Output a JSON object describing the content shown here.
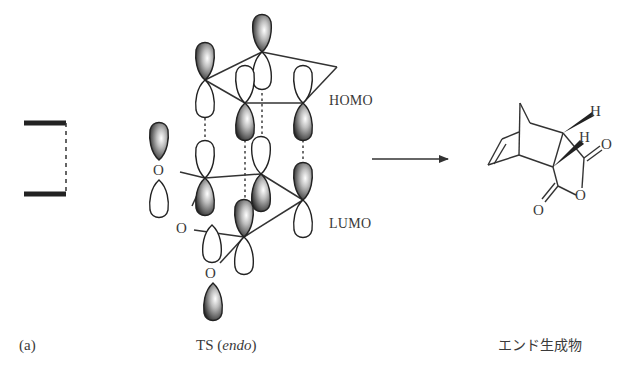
{
  "figure": {
    "panel_label": "(a)",
    "ts_caption_prefix": "TS",
    "ts_caption_paren_open": "(",
    "ts_caption_italic": "endo",
    "ts_caption_paren_close": ")",
    "product_caption": "エンド生成物"
  },
  "orbital_labels": {
    "homo": "HOMO",
    "lumo": "LUMO"
  },
  "atom_labels": {
    "oxygen": "O",
    "hydrogen": "H"
  },
  "colors": {
    "line": "#333333",
    "lobe_shaded": "#2a2a2a",
    "lobe_open": "#ffffff"
  }
}
